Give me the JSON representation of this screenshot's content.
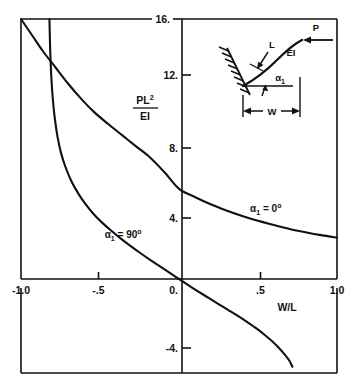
{
  "figure": {
    "name": "buckling-curve-chart",
    "line_color": "#111111",
    "background": "#ffffff"
  },
  "axes": {
    "x_title": "W/L",
    "y_title_numerator": "PL",
    "y_title_numerator_exp": "2",
    "y_title_denominator": "EI",
    "x_ticks": [
      {
        "value": -1.0,
        "label": "-1.0"
      },
      {
        "value": -0.5,
        "label": "-.5"
      },
      {
        "value": 0.0,
        "label": "0."
      },
      {
        "value": 0.5,
        "label": ".5"
      },
      {
        "value": 1.0,
        "label": "1.0"
      }
    ],
    "y_ticks": [
      {
        "value": 16,
        "label": "16."
      },
      {
        "value": 12,
        "label": "12."
      },
      {
        "value": 8,
        "label": "8."
      },
      {
        "value": 4,
        "label": "4."
      },
      {
        "value": -4,
        "label": "-4."
      }
    ],
    "xlim": [
      -1.0,
      1.0
    ],
    "ylim": [
      -5.4,
      16.0
    ]
  },
  "curve_labels": {
    "zero_deg": {
      "alpha": "α",
      "sub": "1",
      "rest": " = 0",
      "deg": "o"
    },
    "ninety_deg": {
      "alpha": "α",
      "sub": "1",
      "rest": " = 90",
      "deg": "o"
    }
  },
  "inset": {
    "name": "cantilever-beam-diagram",
    "label_L": "L",
    "label_EI": "EI",
    "label_P": "P",
    "label_W": "W",
    "label_alpha": "α",
    "label_alpha_sub": "1"
  },
  "chart_data": {
    "type": "line",
    "title": "",
    "xlabel": "W/L",
    "ylabel": "PL2/EI",
    "xlim": [
      -1.0,
      1.0
    ],
    "ylim": [
      -5.4,
      16.0
    ],
    "grid": false,
    "legend": "inline-annotations",
    "xticks": [
      -1.0,
      -0.5,
      0.0,
      0.5,
      1.0
    ],
    "xticklabels": [
      "-1.0",
      "-.5",
      "0.",
      ".5",
      "1.0"
    ],
    "yticks": [
      -4,
      4,
      8,
      12,
      16
    ],
    "yticklabels": [
      "-4.",
      "4.",
      "8.",
      "12.",
      "16."
    ],
    "series": [
      {
        "name": "alpha_1 = 0 deg",
        "annotation": "α₁ = 0º",
        "annotation_x": 0.45,
        "annotation_y": 4.1,
        "points": [
          [
            -1.0,
            16.0
          ],
          [
            -0.93,
            15.0
          ],
          [
            -0.86,
            14.0
          ],
          [
            -0.78,
            13.0
          ],
          [
            -0.7,
            12.0
          ],
          [
            -0.62,
            11.1
          ],
          [
            -0.54,
            10.3
          ],
          [
            -0.45,
            9.55
          ],
          [
            -0.36,
            8.85
          ],
          [
            -0.27,
            8.15
          ],
          [
            -0.18,
            7.45
          ],
          [
            -0.09,
            6.55
          ],
          [
            0.0,
            5.55
          ],
          [
            0.1,
            5.05
          ],
          [
            0.2,
            4.6
          ],
          [
            0.3,
            4.22
          ],
          [
            0.4,
            3.88
          ],
          [
            0.5,
            3.58
          ],
          [
            0.6,
            3.32
          ],
          [
            0.7,
            3.08
          ],
          [
            0.8,
            2.88
          ],
          [
            0.9,
            2.7
          ],
          [
            1.0,
            2.55
          ]
        ]
      },
      {
        "name": "alpha_1 = 90 deg",
        "annotation": "α₁ = 90º",
        "annotation_x": -0.47,
        "annotation_y": 2.55,
        "asymptote_left": -0.82,
        "asymptote_right": 0.73,
        "points": [
          [
            -0.82,
            16.0
          ],
          [
            -0.815,
            14.0
          ],
          [
            -0.808,
            12.4
          ],
          [
            -0.798,
            11.0
          ],
          [
            -0.785,
            9.8
          ],
          [
            -0.768,
            8.7
          ],
          [
            -0.745,
            7.7
          ],
          [
            -0.715,
            6.8
          ],
          [
            -0.68,
            6.0
          ],
          [
            -0.64,
            5.3
          ],
          [
            -0.595,
            4.65
          ],
          [
            -0.545,
            4.05
          ],
          [
            -0.49,
            3.5
          ],
          [
            -0.43,
            2.98
          ],
          [
            -0.37,
            2.5
          ],
          [
            -0.31,
            2.05
          ],
          [
            -0.25,
            1.63
          ],
          [
            -0.19,
            1.23
          ],
          [
            -0.13,
            0.84
          ],
          [
            -0.07,
            0.45
          ],
          [
            0.0,
            0.0
          ],
          [
            0.07,
            -0.45
          ],
          [
            0.13,
            -0.82
          ],
          [
            0.19,
            -1.18
          ],
          [
            0.25,
            -1.54
          ],
          [
            0.31,
            -1.9
          ],
          [
            0.37,
            -2.26
          ],
          [
            0.43,
            -2.64
          ],
          [
            0.49,
            -3.04
          ],
          [
            0.545,
            -3.46
          ],
          [
            0.595,
            -3.88
          ],
          [
            0.64,
            -4.32
          ],
          [
            0.675,
            -4.72
          ],
          [
            0.7,
            -5.05
          ],
          [
            0.718,
            -5.4
          ]
        ]
      }
    ]
  }
}
